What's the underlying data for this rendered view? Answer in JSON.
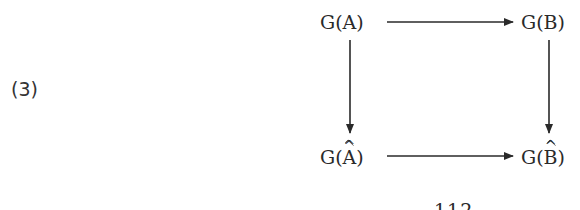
{
  "equation_label": "(3)",
  "diagram": {
    "nodes": {
      "top_left": {
        "prefix": "G(",
        "letter": "A",
        "suffix": ")",
        "hat": false
      },
      "top_right": {
        "prefix": "G(",
        "letter": "B",
        "suffix": ")",
        "hat": false
      },
      "bottom_left": {
        "prefix": "G(",
        "letter": "A",
        "suffix": ")",
        "hat": true,
        "hat_glyph": "^"
      },
      "bottom_right": {
        "prefix": "G(",
        "letter": "B",
        "suffix": ")",
        "hat": true,
        "hat_glyph": "^"
      }
    },
    "arrows": [
      {
        "from": "top_left",
        "to": "top_right"
      },
      {
        "from": "top_left",
        "to": "bottom_left"
      },
      {
        "from": "top_right",
        "to": "bottom_right"
      },
      {
        "from": "bottom_left",
        "to": "bottom_right"
      }
    ]
  },
  "page_number": "112"
}
